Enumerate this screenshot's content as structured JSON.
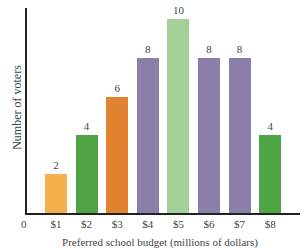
{
  "chart_data": {
    "type": "bar",
    "title": "",
    "xlabel": "Preferred school budget (millions of dollars)",
    "ylabel": "Number of voters",
    "origin_label": "0",
    "categories": [
      "$1",
      "$2",
      "$3",
      "$4",
      "$5",
      "$6",
      "$7",
      "$8"
    ],
    "values": [
      2,
      4,
      6,
      8,
      10,
      8,
      8,
      4
    ],
    "colors": [
      "#f5b04e",
      "#4fa443",
      "#e2812e",
      "#8a7fa8",
      "#a3cf98",
      "#8a7fa8",
      "#8a7fa8",
      "#4fa443"
    ],
    "ylim": [
      0,
      10
    ],
    "grid": false,
    "legend": null,
    "data_labels": true
  }
}
